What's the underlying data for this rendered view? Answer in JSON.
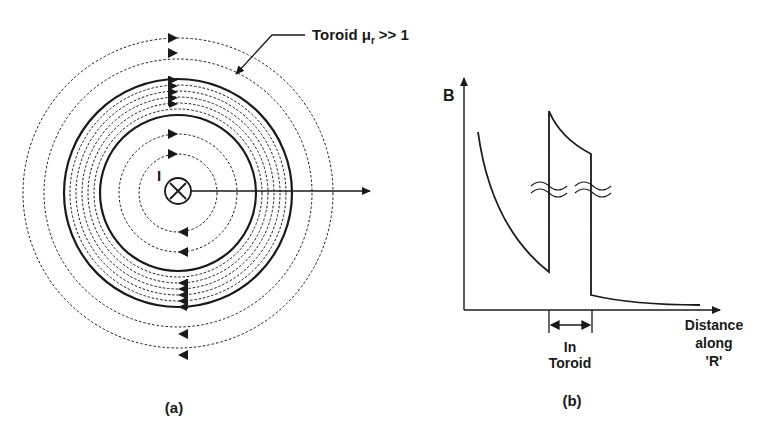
{
  "panel_a": {
    "caption": "(a)",
    "toroid_label": "Toroid μ",
    "toroid_label_sub": "r",
    "toroid_label_tail": ">> 1",
    "current_label": "I",
    "current_symbol": "into-page (⊗)"
  },
  "panel_b": {
    "caption": "(b)",
    "y_label": "B",
    "x_label_line1": "Distance",
    "x_label_line2": "along",
    "x_label_line3": "'R'",
    "region_label_line1": "In",
    "region_label_line2": "Toroid"
  },
  "colors": {
    "ink": "#1a1a1a",
    "background": "#ffffff"
  }
}
